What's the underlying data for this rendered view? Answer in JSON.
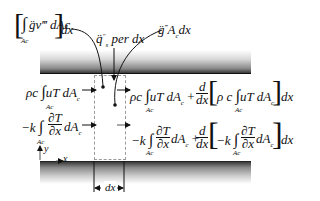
{
  "diagram": {
    "labels": {
      "generation_volumetric": "[∫ g̈v‴ dAc] dx",
      "generation_volumetric_parts": {
        "integral_sub": "Ac",
        "body": "g̈v‴ dAc",
        "tail": "dx"
      },
      "surface_flux": "q̈s″ per dx",
      "surface_flux_parts": {
        "q": "q̈",
        "sub": "s",
        "sup": "″",
        "text": "per dx"
      },
      "generation_total": "g̈‴ Ac dx",
      "generation_total_parts": {
        "g": "g̈",
        "sup": "‴",
        "rest_A": "A",
        "sub": "c",
        "rest": "dx"
      },
      "convection_in": "ρc ∫Ac uT dAc",
      "conduction_in": "−k ∫Ac ∂T/∂x dAc",
      "convection_out": "ρc ∫Ac uT dAc + d/dx[ρ c ∫Ac uT dAc] dx",
      "conduction_out": "−k ∫Ac ∂T/∂x dAc + d/dx[−k ∫Ac ∂T/∂x dAc] dx",
      "axis_x": "x",
      "axis_y": "y",
      "width_marker": "dx"
    },
    "text": {
      "rhoc": "ρc",
      "rho_c_sp": "ρ c",
      "uT": "uT dA",
      "c": "c",
      "Ac": "Ac",
      "minus_k": "−k",
      "dT": "∂T",
      "dx_part": "∂x",
      "dA": "dA",
      "plus": "+",
      "d": "d",
      "dxfrac": "dx",
      "dx": "dx",
      "integral": "∫",
      "lbr": "[",
      "rbr": "]"
    },
    "colors": {
      "plate_dark": "#3a3a3a",
      "dash": "#9a9a9a",
      "ink": "#111111"
    }
  }
}
